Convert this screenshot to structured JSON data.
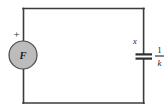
{
  "figure": {
    "type": "schematic",
    "kind": "electrical-circuit",
    "title": "",
    "background_color": "#ffffff",
    "wire_color": "#3b3b3b",
    "source_fill_color": "#bcbcbc",
    "source_stroke_color": "#4a4a4a",
    "label_color": "#1d1d1d"
  },
  "labels": {
    "source_symbol": "F",
    "source_polarity": "+",
    "capacitor_variable": "x",
    "capacitor_value_numerator": "1",
    "capacitor_value_denominator": "k"
  },
  "elements": {
    "loop": {
      "name": "circuit-loop",
      "shape": "rectangle",
      "left": 23,
      "top": 8,
      "right": 144,
      "bottom": 103
    },
    "source": {
      "name": "force-source",
      "shape": "circle",
      "center_x": 23,
      "center_y": 55,
      "radius": 14
    },
    "capacitor": {
      "name": "capacitor",
      "shape": "two-parallel-plates",
      "center_x": 144,
      "center_y": 56,
      "plate_half_width": 8,
      "plate_gap": 4
    }
  },
  "icons": {
    "plus_sign": "plus-icon",
    "capacitor_plates": "capacitor-icon",
    "source_circle": "source-circle-icon"
  }
}
